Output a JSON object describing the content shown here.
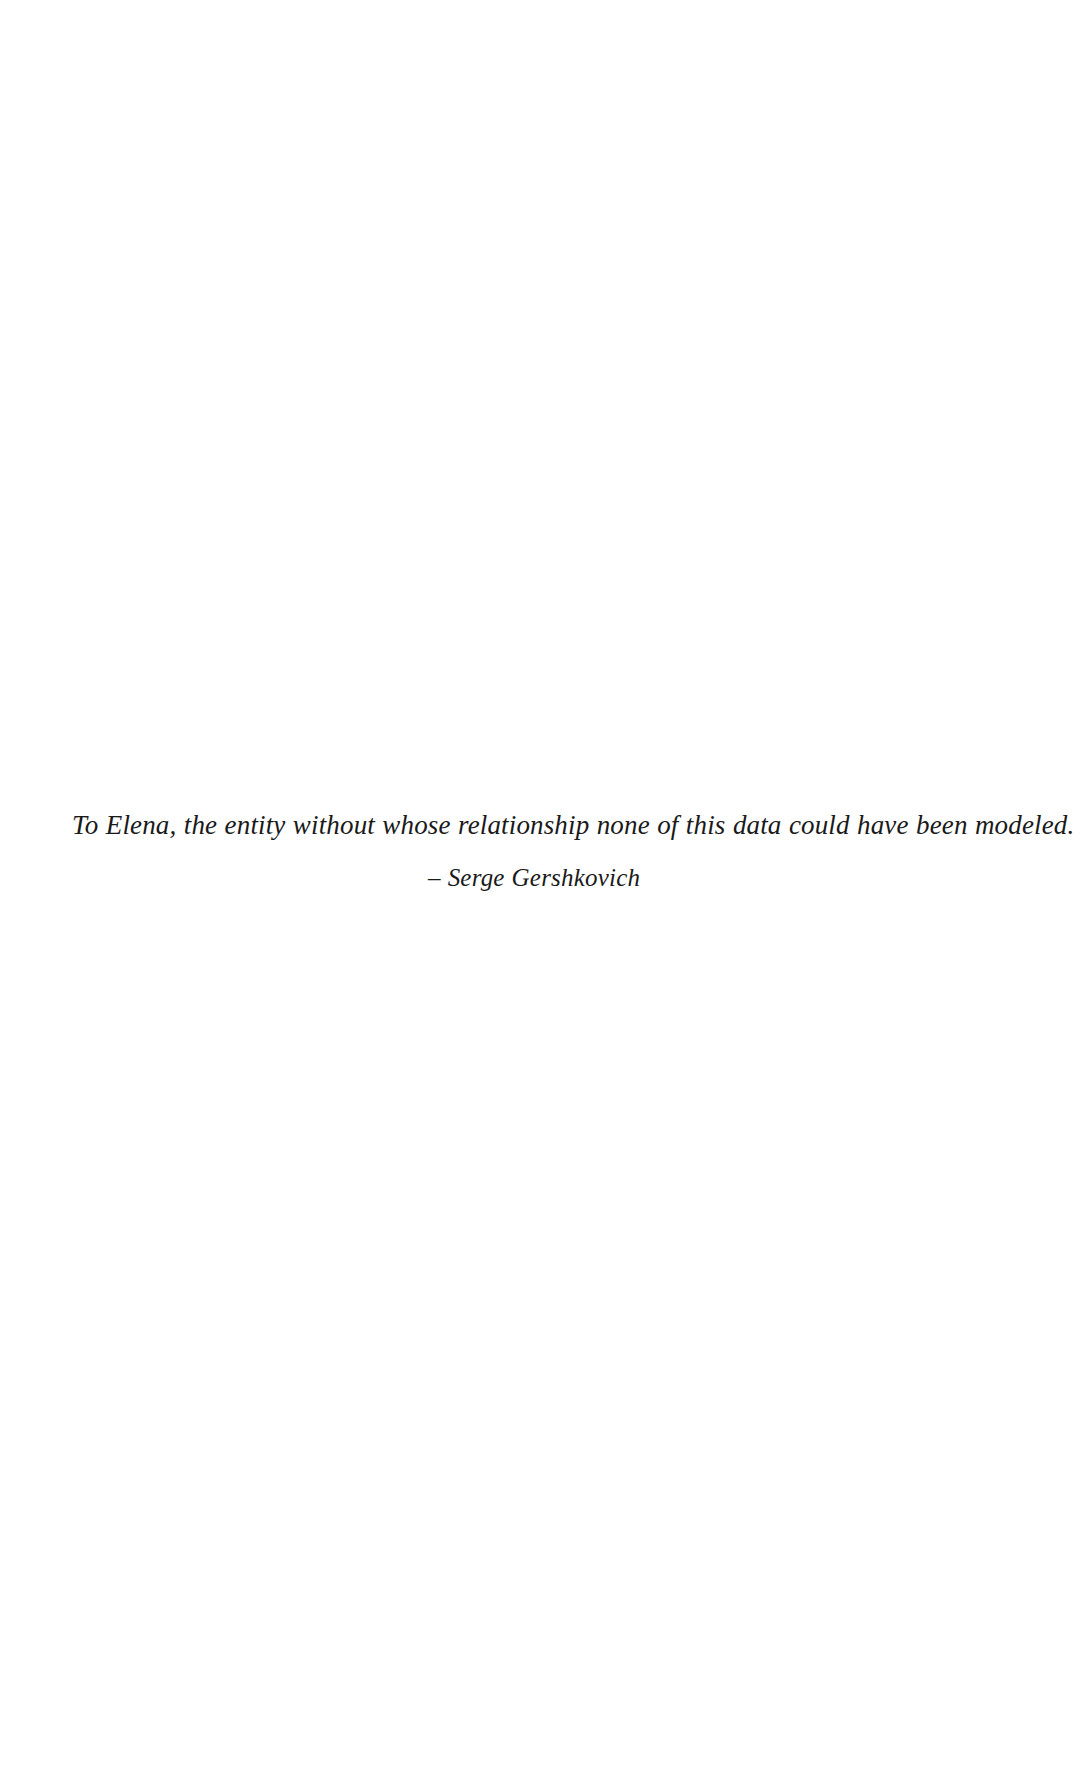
{
  "page": {
    "background_color": "#ffffff",
    "text_color": "#1a1a1a",
    "width": 1089,
    "height": 1775
  },
  "dedication": {
    "text": "To Elena, the entity without whose relationship none of this data could have been modeled.",
    "attribution": "– Serge Gershkovich"
  }
}
